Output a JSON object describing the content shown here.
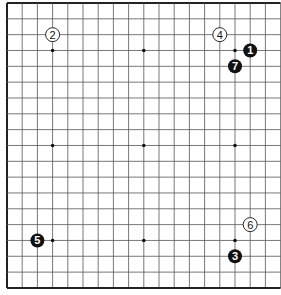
{
  "board": {
    "size": 19,
    "origin_x": 7,
    "origin_y": 3,
    "spacing_x": 15.2,
    "spacing_y": 15.83,
    "line_color": "#555555",
    "border_color": "#222222",
    "star_points": [
      [
        3,
        3
      ],
      [
        9,
        3
      ],
      [
        15,
        3
      ],
      [
        3,
        9
      ],
      [
        9,
        9
      ],
      [
        15,
        9
      ],
      [
        3,
        15
      ],
      [
        9,
        15
      ],
      [
        15,
        15
      ]
    ]
  },
  "stones": [
    {
      "move": "1",
      "color": "black",
      "col": 16,
      "row": 3
    },
    {
      "move": "2",
      "color": "white",
      "col": 3,
      "row": 2
    },
    {
      "move": "3",
      "color": "black",
      "col": 15,
      "row": 16
    },
    {
      "move": "4",
      "color": "white",
      "col": 14,
      "row": 2
    },
    {
      "move": "5",
      "color": "black",
      "col": 2,
      "row": 15
    },
    {
      "move": "6",
      "color": "white",
      "col": 16,
      "row": 14
    },
    {
      "move": "7",
      "color": "black",
      "col": 15,
      "row": 4
    }
  ]
}
